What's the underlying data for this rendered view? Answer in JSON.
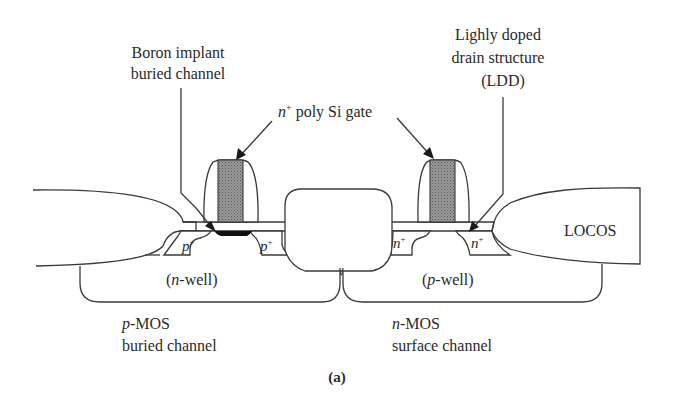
{
  "figure": {
    "panel_label": "(a)",
    "colors": {
      "line": "#3a3a3a",
      "text": "#2a2a2a",
      "poly_gate": "#8a8a8a",
      "buried_channel": "#111111",
      "background": "#ffffff"
    }
  },
  "labels": {
    "boron_implant_line1": "Boron implant",
    "boron_implant_line2": "buried channel",
    "poly_gate_sup": "n",
    "poly_gate_plus": "+",
    "poly_gate_text": " poly Si gate",
    "ldd_line1": "Lighly doped",
    "ldd_line2": "drain structure",
    "ldd_line3": "(LDD)",
    "locos": "LOCOS",
    "p_plus_left": "p",
    "p_plus_right": "p",
    "n_plus_left": "n",
    "n_plus_right": "n",
    "plus": "+",
    "n_well_open": "(",
    "n_well_n": "n",
    "n_well_rest": "-well)",
    "p_well_open": "(",
    "p_well_p": "p",
    "p_well_rest": "-well)",
    "pmos_prefix": "p",
    "pmos_suffix": "-MOS",
    "pmos_line2": "buried channel",
    "nmos_prefix": "n",
    "nmos_suffix": "-MOS",
    "nmos_line2": "surface channel"
  }
}
